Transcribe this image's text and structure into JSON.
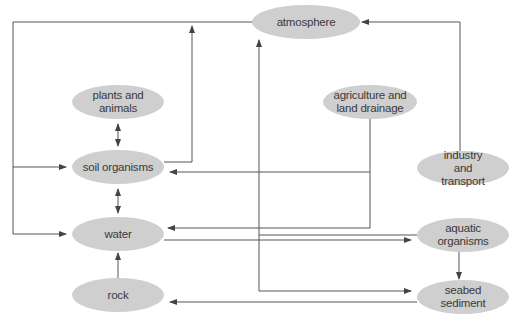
{
  "diagram": {
    "colors": {
      "node_fill": "#cfcfcf",
      "line": "#555555",
      "text": "#3a3a3a",
      "background": "#ffffff"
    },
    "nodes": [
      {
        "id": "atmosphere",
        "label": "atmosphere",
        "cx": 306,
        "cy": 22,
        "rx": 54,
        "ry": 17
      },
      {
        "id": "plants-and-animals",
        "label": "plants and\nanimals",
        "cx": 118,
        "cy": 102,
        "rx": 46,
        "ry": 17
      },
      {
        "id": "agriculture-and-land-drainage",
        "label": "agriculture and\nland drainage",
        "cx": 370,
        "cy": 102,
        "rx": 46,
        "ry": 17
      },
      {
        "id": "soil-organisms",
        "label": "soil organisms",
        "cx": 118,
        "cy": 167,
        "rx": 46,
        "ry": 17
      },
      {
        "id": "industry-and-transport",
        "label": "industry and\ntransport",
        "cx": 463,
        "cy": 168,
        "rx": 46,
        "ry": 17
      },
      {
        "id": "water",
        "label": "water",
        "cx": 118,
        "cy": 234,
        "rx": 46,
        "ry": 17
      },
      {
        "id": "aquatic-organisms",
        "label": "aquatic\norganisms",
        "cx": 463,
        "cy": 235,
        "rx": 46,
        "ry": 17
      },
      {
        "id": "rock",
        "label": "rock",
        "cx": 118,
        "cy": 295,
        "rx": 46,
        "ry": 17
      },
      {
        "id": "seabed-sediment",
        "label": "seabed\nsediment",
        "cx": 463,
        "cy": 297,
        "rx": 46,
        "ry": 17
      }
    ],
    "edges": [
      {
        "from": "atmosphere",
        "to": "soil-organisms"
      },
      {
        "from": "atmosphere",
        "to": "water"
      },
      {
        "from": "soil-organisms",
        "to": "atmosphere"
      },
      {
        "from": "aquatic-organisms",
        "to": "atmosphere"
      },
      {
        "from": "industry-and-transport",
        "to": "atmosphere"
      },
      {
        "from": "plants-and-animals",
        "to": "soil-organisms",
        "bidirectional": true
      },
      {
        "from": "soil-organisms",
        "to": "water",
        "bidirectional": true
      },
      {
        "from": "agriculture-and-land-drainage",
        "to": "soil-organisms"
      },
      {
        "from": "agriculture-and-land-drainage",
        "to": "water"
      },
      {
        "from": "water",
        "to": "aquatic-organisms"
      },
      {
        "from": "aquatic-organisms",
        "to": "seabed-sediment"
      },
      {
        "from": "aquatic-organisms",
        "to": "seabed-sediment",
        "via": "left-loop"
      },
      {
        "from": "seabed-sediment",
        "to": "rock"
      },
      {
        "from": "rock",
        "to": "water"
      }
    ]
  }
}
